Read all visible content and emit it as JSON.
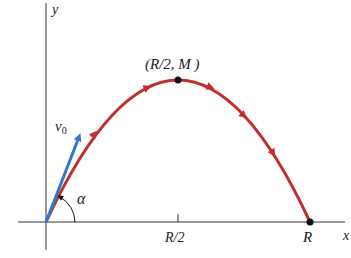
{
  "figure": {
    "axes": {
      "x_label": "x",
      "y_label": "y"
    },
    "trajectory": {
      "color": "#c0302a",
      "peak_label": "(R/2, M )",
      "range_label": "R",
      "half_range_tick_label": "R/2"
    },
    "velocity": {
      "label": "v",
      "subscript": "0",
      "color": "#2a7ad4"
    },
    "angle": {
      "label": "α"
    }
  }
}
